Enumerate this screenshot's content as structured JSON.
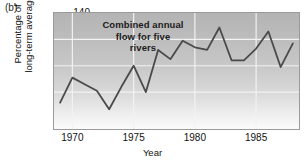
{
  "panel": {
    "label": "(b)"
  },
  "annotation": {
    "lines": [
      "Combined annual",
      "flow for five",
      "rivers"
    ]
  },
  "axes": {
    "ylabel_line1": "Percentage of",
    "ylabel_line2": "long-term average",
    "xlabel": "Year",
    "yticks": [
      60,
      80,
      100,
      120,
      140
    ],
    "xticks": [
      1970,
      1975,
      1980,
      1985
    ]
  },
  "style": {
    "line_color": "#4a4a4a",
    "grid_color": "#f2f2f2",
    "frame_color": "#9a9a9a",
    "bg_top": "#b4b4b4",
    "bg_bottom": "#fbfbfb"
  },
  "chart_data": {
    "type": "line",
    "title": "Combined annual flow for five rivers",
    "xlabel": "Year",
    "ylabel": "Percentage of long-term average",
    "xlim": [
      1968.5,
      1988.5
    ],
    "ylim": [
      52,
      140
    ],
    "grid": true,
    "legend": "none",
    "x": [
      1969,
      1970,
      1971,
      1972,
      1973,
      1974,
      1975,
      1976,
      1977,
      1978,
      1979,
      1980,
      1981,
      1982,
      1983,
      1984,
      1985,
      1986,
      1987,
      1988
    ],
    "values": [
      72,
      91,
      86,
      81,
      67,
      84,
      100,
      80,
      112,
      105,
      119,
      114,
      112,
      129,
      104,
      104,
      113,
      126,
      99,
      117
    ],
    "series": [
      {
        "name": "Combined annual flow for five rivers",
        "values": [
          72,
          91,
          86,
          81,
          67,
          84,
          100,
          80,
          112,
          105,
          119,
          114,
          112,
          129,
          104,
          104,
          113,
          126,
          99,
          117
        ]
      }
    ]
  }
}
